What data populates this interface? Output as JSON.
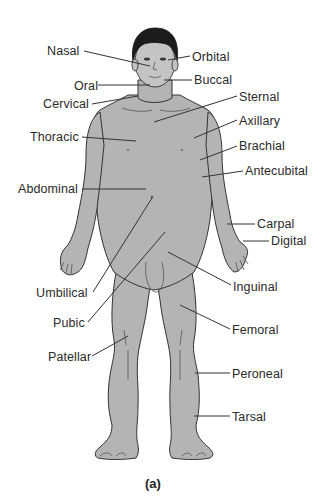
{
  "figure": {
    "caption": "(a)",
    "colors": {
      "body_fill": "#b4b4b4",
      "outline": "#333333",
      "hair": "#1c1c1c",
      "text": "#2a2a2a",
      "background": "#ffffff"
    },
    "labels_left": [
      {
        "id": "nasal",
        "text": "Nasal"
      },
      {
        "id": "oral",
        "text": "Oral"
      },
      {
        "id": "cervical",
        "text": "Cervical"
      },
      {
        "id": "thoracic",
        "text": "Thoracic"
      },
      {
        "id": "abdominal",
        "text": "Abdominal"
      },
      {
        "id": "umbilical",
        "text": "Umbilical"
      },
      {
        "id": "pubic",
        "text": "Pubic"
      },
      {
        "id": "patellar",
        "text": "Patellar"
      }
    ],
    "labels_right": [
      {
        "id": "orbital",
        "text": "Orbital"
      },
      {
        "id": "buccal",
        "text": "Buccal"
      },
      {
        "id": "sternal",
        "text": "Sternal"
      },
      {
        "id": "axillary",
        "text": "Axillary"
      },
      {
        "id": "brachial",
        "text": "Brachial"
      },
      {
        "id": "antecubital",
        "text": "Antecubital"
      },
      {
        "id": "carpal",
        "text": "Carpal"
      },
      {
        "id": "digital",
        "text": "Digital"
      },
      {
        "id": "inguinal",
        "text": "Inguinal"
      },
      {
        "id": "femoral",
        "text": "Femoral"
      },
      {
        "id": "peroneal",
        "text": "Peroneal"
      },
      {
        "id": "tarsal",
        "text": "Tarsal"
      }
    ]
  }
}
